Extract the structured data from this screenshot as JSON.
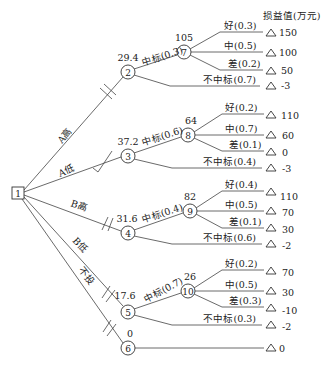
{
  "header": {
    "payoff_label": "损益值(万元)"
  },
  "decision_node": {
    "id": "1"
  },
  "branches": [
    {
      "label": "A高",
      "chance_node": "2",
      "ev": "29.4",
      "win_label": "中标(0.3)",
      "lose_label": "不中标(0.7)",
      "lose_payoff": "-3",
      "sub_node": "7",
      "sub_ev": "105",
      "outcomes": [
        {
          "label": "好(0.3)",
          "payoff": "150"
        },
        {
          "label": "中(0.5)",
          "payoff": "100"
        },
        {
          "label": "差(0.2)",
          "payoff": "50"
        }
      ]
    },
    {
      "label": "A低",
      "chance_node": "3",
      "ev": "37.2",
      "win_label": "中标(0.6)",
      "lose_label": "不中标(0.4)",
      "lose_payoff": "-3",
      "sub_node": "8",
      "sub_ev": "64",
      "outcomes": [
        {
          "label": "好(0.2)",
          "payoff": "110"
        },
        {
          "label": "中(0.7)",
          "payoff": "60"
        },
        {
          "label": "差(0.1)",
          "payoff": "0"
        }
      ]
    },
    {
      "label": "B高",
      "chance_node": "4",
      "ev": "31.6",
      "win_label": "中标(0.4)",
      "lose_label": "不中标(0.6)",
      "lose_payoff": "-2",
      "sub_node": "9",
      "sub_ev": "82",
      "outcomes": [
        {
          "label": "好(0.4)",
          "payoff": "110"
        },
        {
          "label": "中(0.5)",
          "payoff": "70"
        },
        {
          "label": "差(0.1)",
          "payoff": "30"
        }
      ]
    },
    {
      "label": "B低",
      "chance_node": "5",
      "ev": "17.6",
      "win_label": "中标(0.7)",
      "lose_label": "不中标(0.3)",
      "lose_payoff": "-2",
      "sub_node": "10",
      "sub_ev": "26",
      "outcomes": [
        {
          "label": "好(0.2)",
          "payoff": "70"
        },
        {
          "label": "中(0.5)",
          "payoff": "30"
        },
        {
          "label": "差(0.3)",
          "payoff": "-10"
        }
      ]
    },
    {
      "label": "不投",
      "chance_node": "6",
      "ev": "0",
      "payoff": "0"
    }
  ]
}
